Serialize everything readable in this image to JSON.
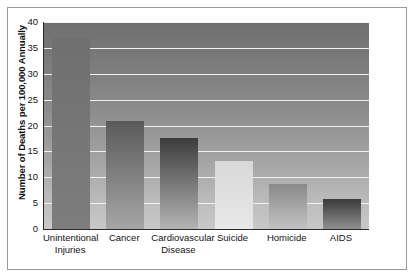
{
  "chart_data": {
    "type": "bar",
    "title": "",
    "subtitle": "",
    "xlabel": "",
    "ylabel": "Number of Deaths per 100,000 Annually",
    "ylim": [
      0,
      40
    ],
    "ytick_labels": [
      "40",
      "35",
      "30",
      "25",
      "20",
      "15",
      "10",
      "5",
      "0"
    ],
    "yticks": [
      40,
      35,
      30,
      25,
      20,
      15,
      10,
      5,
      0
    ],
    "grid": true,
    "legend": null,
    "categories": [
      "Unintentional Injuries",
      "Cancer",
      "Cardiovascular Disease",
      "Suicide",
      "Homicide",
      "AIDS"
    ],
    "category_lines": [
      [
        "Unintentional",
        "Injuries"
      ],
      [
        "Cancer",
        ""
      ],
      [
        "Cardiovascular",
        "Disease"
      ],
      [
        "Suicide",
        ""
      ],
      [
        "Homicide",
        ""
      ],
      [
        "AIDS",
        ""
      ]
    ],
    "values": [
      36.9,
      20.8,
      17.6,
      13.1,
      8.7,
      5.8
    ],
    "bar_styles": [
      {
        "top": "#6f6f6f",
        "bottom": "#7d7d7d"
      },
      {
        "top": "#5a5a5a",
        "bottom": "#a6a6a6"
      },
      {
        "top": "#3c3c3c",
        "bottom": "#b4b4b4"
      },
      {
        "top": "#d8d8d8",
        "bottom": "#e8e8e8"
      },
      {
        "top": "#8a8a8a",
        "bottom": "#c2c2c2"
      },
      {
        "top": "#3a3a3a",
        "bottom": "#8f8f8f"
      }
    ]
  },
  "colors": {
    "frame_border": "#9a9a9a",
    "axis_line": "#2a2a2a",
    "gridline": "#f2f2f2",
    "text": "#141414",
    "page_background": "#ffffff"
  }
}
